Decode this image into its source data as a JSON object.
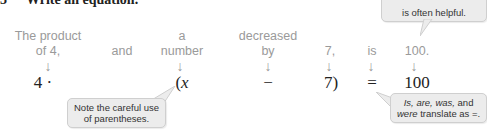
{
  "heading": {
    "number": "3",
    "label": "Write an equation."
  },
  "phrases": [
    {
      "line1": "The product",
      "line2": "of 4,"
    },
    {
      "line1": "",
      "line2": "and"
    },
    {
      "line1": "a",
      "line2": "number"
    },
    {
      "line1": "decreased",
      "line2": "by"
    },
    {
      "line1": "",
      "line2": "7,"
    },
    {
      "line1": "",
      "line2": "is"
    },
    {
      "line1": "",
      "line2": "100."
    }
  ],
  "arrow_glyph": "↓",
  "equation": {
    "term1": "4 ·",
    "term2": "(x",
    "term3": "−",
    "term4": "7)",
    "term5": "=",
    "term6": "100"
  },
  "callouts": {
    "top_right": {
      "line1": "…",
      "line2": "is often helpful."
    },
    "parentheses": {
      "line1": "Note the careful use",
      "line2": "of parentheses."
    },
    "translate": {
      "line1_italic": "Is, are, was,",
      "line1_rest": " and",
      "line2_italic": "were",
      "line2_rest": " translate as =."
    }
  },
  "colors": {
    "phrase_text": "#9a9a9a",
    "callout_bg": "#ececec",
    "equation_text": "#222222"
  }
}
